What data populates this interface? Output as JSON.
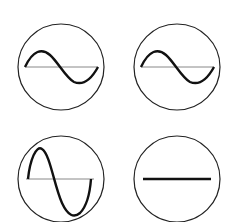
{
  "diagram": {
    "type": "waveform-icons",
    "stroke_color": "#111111",
    "axis_color": "#888888",
    "panels": [
      {
        "id": "top-left",
        "waveform": "sine",
        "amplitude": "medium",
        "cx": 61,
        "cy": 67
      },
      {
        "id": "top-right",
        "waveform": "sine",
        "amplitude": "medium",
        "cx": 177,
        "cy": 67
      },
      {
        "id": "bottom-left",
        "waveform": "sine",
        "amplitude": "large",
        "cx": 61,
        "cy": 179
      },
      {
        "id": "bottom-right",
        "waveform": "flat",
        "amplitude": "zero",
        "cx": 177,
        "cy": 179
      }
    ]
  }
}
